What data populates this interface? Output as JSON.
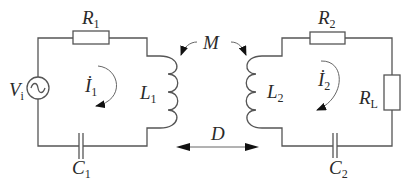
{
  "diagram": {
    "type": "coupled-inductor circuit (wireless power transfer)",
    "stroke_color": "#555555",
    "labels": {
      "R1": {
        "main": "R",
        "sub": "1"
      },
      "R2": {
        "main": "R",
        "sub": "2"
      },
      "RL": {
        "main": "R",
        "sub": "L"
      },
      "L1": {
        "main": "L",
        "sub": "1"
      },
      "L2": {
        "main": "L",
        "sub": "2"
      },
      "C1": {
        "main": "C",
        "sub": "1"
      },
      "C2": {
        "main": "C",
        "sub": "2"
      },
      "Vi": {
        "main": "V",
        "sub": "i"
      },
      "I1": {
        "main": "İ",
        "sub": "1"
      },
      "I2": {
        "main": "İ",
        "sub": "2"
      },
      "M": {
        "main": "M"
      },
      "D": {
        "main": "D"
      }
    },
    "components": [
      {
        "id": "Vi",
        "kind": "ac-source",
        "loop": "primary"
      },
      {
        "id": "R1",
        "kind": "resistor",
        "loop": "primary"
      },
      {
        "id": "L1",
        "kind": "inductor",
        "loop": "primary"
      },
      {
        "id": "C1",
        "kind": "capacitor",
        "loop": "primary"
      },
      {
        "id": "L2",
        "kind": "inductor",
        "loop": "secondary"
      },
      {
        "id": "R2",
        "kind": "resistor",
        "loop": "secondary"
      },
      {
        "id": "RL",
        "kind": "resistor",
        "loop": "secondary"
      },
      {
        "id": "C2",
        "kind": "capacitor",
        "loop": "secondary"
      }
    ],
    "annotations": [
      {
        "id": "M",
        "meaning": "mutual inductance between L1 and L2"
      },
      {
        "id": "D",
        "meaning": "distance between coils"
      },
      {
        "id": "I1",
        "meaning": "primary loop current, clockwise"
      },
      {
        "id": "I2",
        "meaning": "secondary loop current, clockwise"
      }
    ]
  }
}
